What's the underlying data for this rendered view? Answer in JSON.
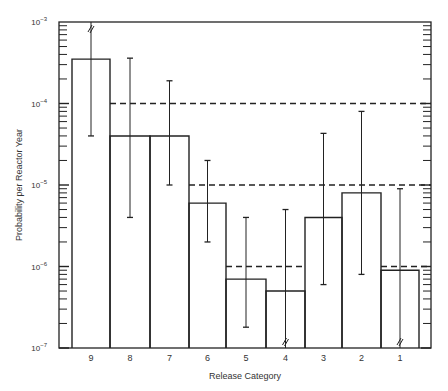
{
  "chart_data": {
    "type": "bar",
    "title": "",
    "xlabel": "Release Category",
    "ylabel": "Probability per Reactor Year",
    "yscale": "log",
    "ylim": [
      1e-07,
      0.001
    ],
    "y_ticks": [
      {
        "base": "10",
        "exp": "-3",
        "value": 0.001
      },
      {
        "base": "10",
        "exp": "-4",
        "value": 0.0001
      },
      {
        "base": "10",
        "exp": "-5",
        "value": 1e-05
      },
      {
        "base": "10",
        "exp": "-6",
        "value": 1e-06
      },
      {
        "base": "10",
        "exp": "-7",
        "value": 1e-07
      }
    ],
    "categories": [
      "9",
      "8",
      "7",
      "6",
      "5",
      "4",
      "3",
      "2",
      "1"
    ],
    "values": [
      0.00035,
      4e-05,
      4e-05,
      6e-06,
      7e-07,
      5e-07,
      4e-06,
      8e-06,
      9e-07
    ],
    "error_bars": [
      {
        "category": "9",
        "low": 4e-05,
        "high": 0.001,
        "high_broken": true
      },
      {
        "category": "8",
        "low": 4e-06,
        "high": 0.00036
      },
      {
        "category": "7",
        "low": 1e-05,
        "high": 0.00019
      },
      {
        "category": "6",
        "low": 2e-06,
        "high": 2e-05
      },
      {
        "category": "5",
        "low": 1.8e-07,
        "high": 4e-06
      },
      {
        "category": "4",
        "low": 1e-07,
        "high": 5e-06,
        "low_broken": true
      },
      {
        "category": "3",
        "low": 6e-07,
        "high": 4.3e-05
      },
      {
        "category": "2",
        "low": 8e-07,
        "high": 8e-05
      },
      {
        "category": "1",
        "low": 1e-07,
        "high": 9e-06,
        "low_broken": true
      }
    ],
    "reference_lines": [
      {
        "value": 0.0001,
        "from_category": "8",
        "to_category": "1",
        "style": "dashed"
      },
      {
        "value": 1e-05,
        "from_category": "6",
        "to_category": "1",
        "style": "dashed"
      },
      {
        "value": 1e-06,
        "from_category": "5",
        "to_category": "4",
        "style": "dashed"
      },
      {
        "value": 1e-06,
        "from_category": "1",
        "to_category": "1",
        "style": "dashed"
      }
    ],
    "grid": false,
    "legend": null
  }
}
